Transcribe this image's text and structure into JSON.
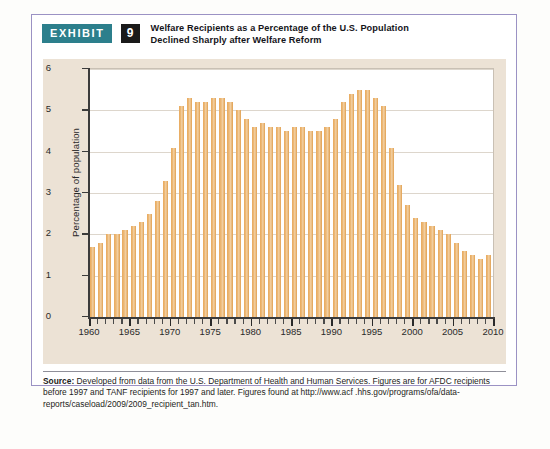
{
  "exhibit": {
    "badge_label": "EXHIBIT",
    "number": "9",
    "title_line1": "Welfare Recipients as a Percentage of the U.S. Population",
    "title_line2": "Declined Sharply after Welfare Reform",
    "badge_color": "#2c7f8c",
    "number_badge_color": "#1a1a1a",
    "frame_color": "#9b92c4",
    "panel_color": "#ece2d5"
  },
  "source": {
    "label": "Source:",
    "text": " Developed from data from the U.S. Department of Health and Human Services. Figures are for AFDC recipients before 1997 and TANF recipients for 1997 and later. Figures found at http://www.acf .hhs.gov/programs/ofa/data-reports/caseload/2009/2009_recipient_tan.htm."
  },
  "chart_data": {
    "type": "bar",
    "title": "Welfare Recipients as a Percentage of the U.S. Population Declined Sharply after Welfare Reform",
    "xlabel": "",
    "ylabel": "Percentage of population",
    "ylim": [
      0,
      6
    ],
    "xlim": [
      1960,
      2010
    ],
    "ytick_labels": [
      "0",
      "1",
      "2",
      "3",
      "4",
      "5",
      "6"
    ],
    "yticks": [
      0,
      1,
      2,
      3,
      4,
      5,
      6
    ],
    "xtick_labels": [
      "1960",
      "1965",
      "1970",
      "1975",
      "1980",
      "1985",
      "1990",
      "1995",
      "2000",
      "2005",
      "2010"
    ],
    "xticks": [
      1960,
      1965,
      1970,
      1975,
      1980,
      1985,
      1990,
      1995,
      2000,
      2005,
      2010
    ],
    "grid": true,
    "legend": null,
    "bar_color": "#e8a95c",
    "plot_background": "#ffffff",
    "categories": [
      1960,
      1961,
      1962,
      1963,
      1964,
      1965,
      1966,
      1967,
      1968,
      1969,
      1970,
      1971,
      1972,
      1973,
      1974,
      1975,
      1976,
      1977,
      1978,
      1979,
      1980,
      1981,
      1982,
      1983,
      1984,
      1985,
      1986,
      1987,
      1988,
      1989,
      1990,
      1991,
      1992,
      1993,
      1994,
      1995,
      1996,
      1997,
      1998,
      1999,
      2000,
      2001,
      2002,
      2003,
      2004,
      2005,
      2006,
      2007,
      2008,
      2009
    ],
    "values": [
      1.7,
      1.8,
      2.0,
      2.0,
      2.1,
      2.2,
      2.3,
      2.5,
      2.8,
      3.3,
      4.1,
      5.1,
      5.3,
      5.2,
      5.2,
      5.3,
      5.3,
      5.2,
      5.0,
      4.8,
      4.6,
      4.7,
      4.6,
      4.6,
      4.5,
      4.6,
      4.6,
      4.5,
      4.5,
      4.6,
      4.8,
      5.2,
      5.4,
      5.5,
      5.5,
      5.3,
      5.1,
      4.1,
      3.2,
      2.7,
      2.4,
      2.3,
      2.2,
      2.1,
      2.0,
      1.8,
      1.6,
      1.5,
      1.4,
      1.5
    ]
  }
}
